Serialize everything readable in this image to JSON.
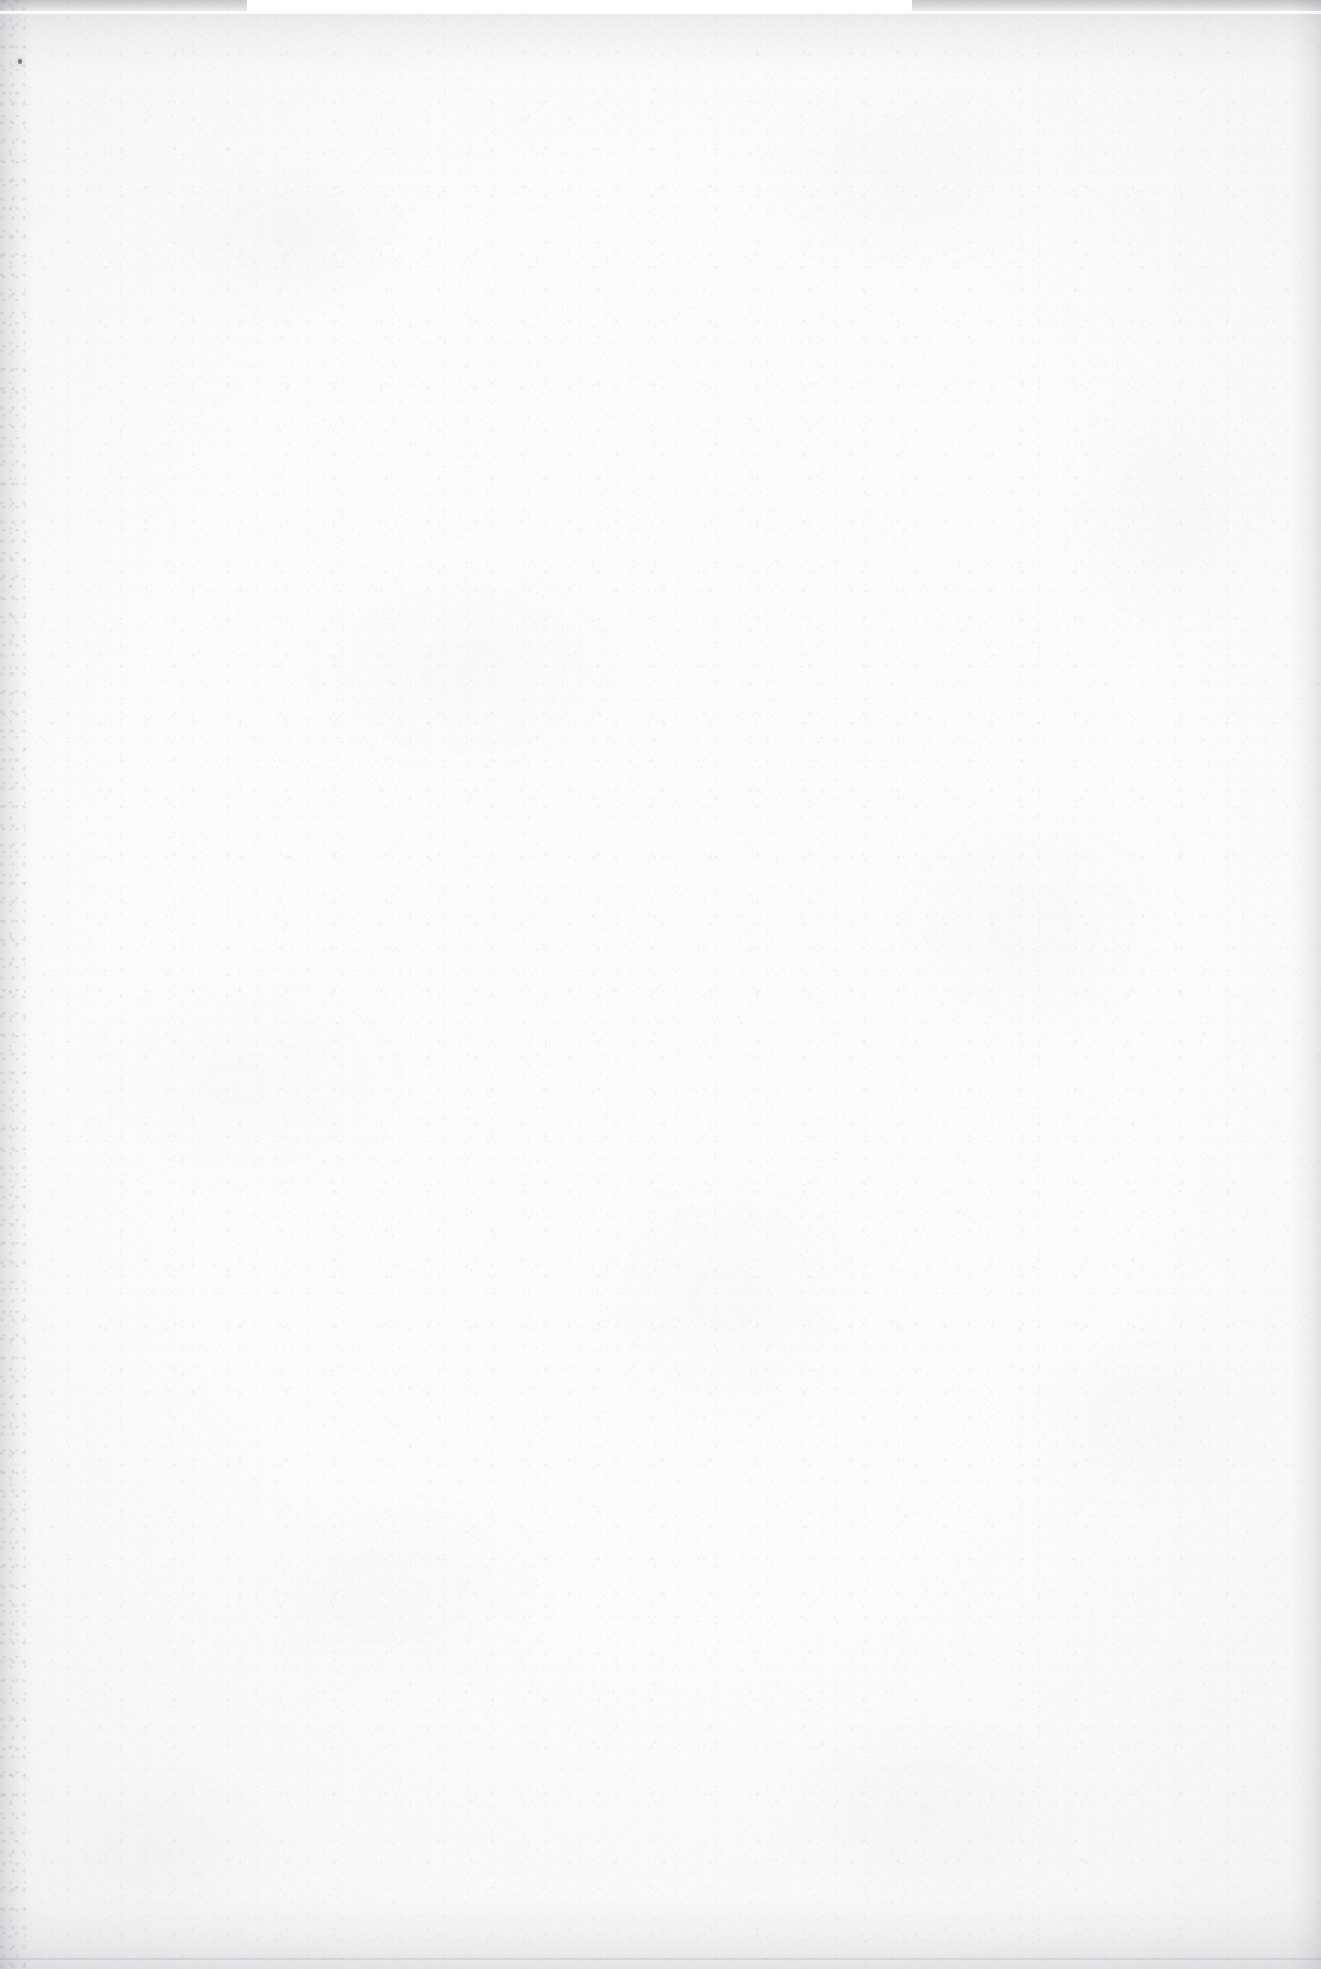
{
  "page": {
    "kind": "scanned-document-page",
    "content_text": "",
    "is_blank": true,
    "width_px": 1321,
    "height_px": 1969
  },
  "appearance": {
    "paper_color": "#fcfcfc",
    "base_white": "#ffffff",
    "grain_color": "#78787d",
    "mottle_color": "#a0a0a8",
    "edge_shadow_color": "#78788a",
    "speck_color": "#3c3c42",
    "scan_rule_color": "#ffffff"
  },
  "artifacts": {
    "top_dark_band": {
      "height_px": 13
    },
    "top_scan_rule_line": {
      "top_px": 11,
      "height_px": 3
    },
    "top_white_notch": {
      "left_px": 247,
      "width_px": 665,
      "height_px": 11
    },
    "left_edge_band": {
      "width_px": 34
    },
    "right_edge_band": {
      "width_px": 30
    },
    "bottom_edge_band": {
      "height_px": 70
    },
    "bottom_rule_line": {
      "bottom_px": 9,
      "height_px": 2
    },
    "dust_speck": {
      "left_px": 18,
      "top_px": 59,
      "width_px": 4,
      "height_px": 5
    }
  }
}
